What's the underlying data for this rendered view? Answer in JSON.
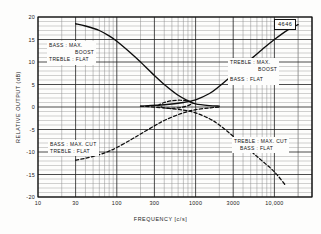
{
  "figure": {
    "number": "4646",
    "xlabel": "FREQUENCY [c/s]",
    "ylabel": "RELATIVE OUTPUT (dB)"
  },
  "annotations": {
    "bass_boost": {
      "line1": "BASS : MAX.",
      "line2": "BOOST",
      "line3": "TREBLE : FLAT"
    },
    "treble_boost": {
      "line1": "TREBLE : MAX.",
      "line2": "BOOST",
      "line3": "BASS : FLAT"
    },
    "bass_cut": {
      "line1": "BASS : MAX. CUT",
      "line2": "TREBLE : FLAT"
    },
    "treble_cut": {
      "line1": "TREBLE : MAX. CUT",
      "line2": "BASS : FLAT"
    }
  },
  "axes": {
    "x_ticks": [
      "10",
      "30",
      "100",
      "300",
      "1000",
      "3000",
      "10,000"
    ],
    "y_ticks": [
      "20",
      "15",
      "10",
      "5",
      "0",
      "-5",
      "-10",
      "-15",
      "-20"
    ]
  },
  "chart_data": {
    "type": "line",
    "title": "",
    "xlabel": "FREQUENCY [c/s]",
    "ylabel": "RELATIVE OUTPUT (dB)",
    "xscale": "log",
    "xlim": [
      10,
      30000
    ],
    "ylim": [
      -20,
      20
    ],
    "grid": true,
    "legend": "annotations-in-plot",
    "series": [
      {
        "name": "BASS : MAX. BOOST / TREBLE : FLAT",
        "style": "solid",
        "x": [
          30,
          40,
          60,
          80,
          100,
          150,
          200,
          300,
          400,
          600,
          800,
          1000,
          1500,
          2000
        ],
        "y": [
          18.5,
          18.0,
          17.0,
          15.8,
          14.6,
          12.0,
          10.0,
          7.0,
          5.0,
          2.6,
          1.4,
          0.7,
          0.3,
          0.2
        ]
      },
      {
        "name": "TREBLE : MAX. BOOST / BASS : FLAT",
        "style": "solid",
        "x": [
          200,
          400,
          700,
          1000,
          1500,
          2000,
          3000,
          5000,
          7000,
          10000,
          15000,
          20000
        ],
        "y": [
          0.2,
          0.5,
          1.0,
          1.6,
          3.0,
          4.6,
          7.2,
          10.6,
          12.8,
          15.0,
          17.2,
          18.3
        ]
      },
      {
        "name": "BASS : MAX. CUT / TREBLE : FLAT",
        "style": "dashed",
        "x": [
          30,
          40,
          60,
          80,
          100,
          150,
          200,
          300,
          400,
          600,
          800,
          1000,
          1500,
          2000
        ],
        "y": [
          -11.8,
          -11.4,
          -10.6,
          -9.8,
          -9.0,
          -7.3,
          -6.0,
          -4.2,
          -3.0,
          -1.7,
          -1.0,
          -0.6,
          -0.2,
          0.0
        ]
      },
      {
        "name": "TREBLE : MAX. CUT / BASS : FLAT",
        "style": "dashed",
        "x": [
          200,
          400,
          700,
          1000,
          1500,
          2000,
          3000,
          5000,
          7000,
          10000,
          14000
        ],
        "y": [
          0.2,
          -0.2,
          -0.7,
          -1.3,
          -2.6,
          -4.0,
          -6.5,
          -9.8,
          -12.0,
          -14.4,
          -17.5
        ]
      },
      {
        "name": "mid-band convergence loop",
        "style": "dashed",
        "x": [
          330,
          400,
          500,
          650,
          800,
          900,
          800,
          650,
          500,
          400,
          340
        ],
        "y": [
          0.3,
          1.0,
          1.4,
          1.5,
          1.3,
          0.9,
          0.3,
          -0.1,
          -0.3,
          -0.2,
          0.3
        ]
      }
    ]
  }
}
